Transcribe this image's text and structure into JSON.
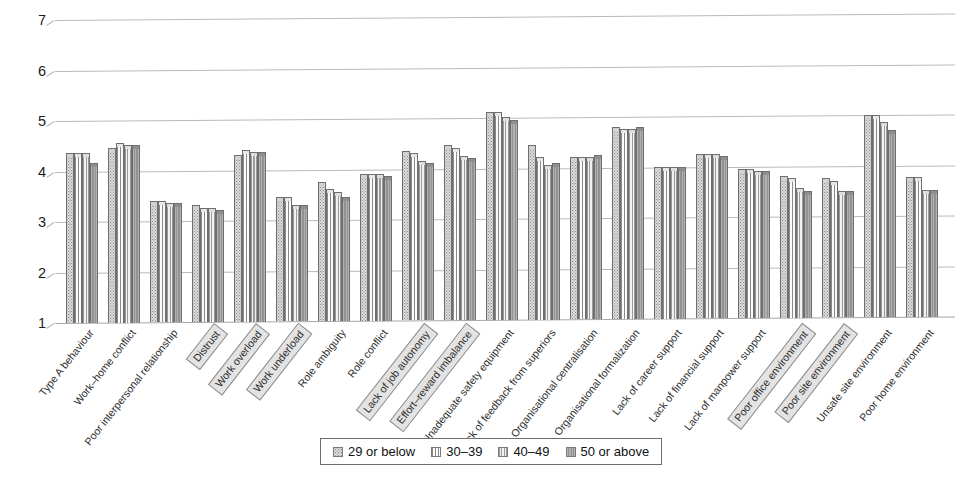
{
  "chart_data": {
    "type": "bar",
    "title": "",
    "subtitle": "",
    "xlabel": "",
    "ylabel": "",
    "ylim": [
      1,
      7
    ],
    "yticks": [
      1,
      2,
      3,
      4,
      5,
      6,
      7
    ],
    "ytick_labels": [
      "1",
      "2",
      "3",
      "4",
      "5",
      "6",
      "7"
    ],
    "grid": true,
    "legend_position": "bottom",
    "categories": [
      "Type A behaviour",
      "Work–home conflict",
      "Poor interpersonal relationship",
      "Distrust",
      "Work overload",
      "Work underload",
      "Role ambiguity",
      "Role conflict",
      "Lack of job autonomy",
      "Effort–reward imbalance",
      "Inadequate safety equipment",
      "Lack of feedback from superiors",
      "Organisational centralisation",
      "Organisational formalization",
      "Lack of career support",
      "Lack of financial support",
      "Lack of manpower support",
      "Poor office environment",
      "Poor site environment",
      "Unsafe site environment",
      "Poor home environment"
    ],
    "highlighted_categories": [
      "Distrust",
      "Work overload",
      "Work underload",
      "Lack of job autonomy",
      "Effort–reward imbalance",
      "Poor office environment",
      "Poor site environment"
    ],
    "series": [
      {
        "name": "29 or below",
        "pattern": "checkered",
        "color": "#dcdcdc",
        "values": [
          4.3,
          4.4,
          3.35,
          3.25,
          4.25,
          3.4,
          3.7,
          3.85,
          4.3,
          4.4,
          5.05,
          4.4,
          4.15,
          4.75,
          3.95,
          4.2,
          3.9,
          3.75,
          3.7,
          4.95,
          3.7
        ]
      },
      {
        "name": "30–39",
        "pattern": "vertical-lines",
        "color": "#f2f2f2",
        "values": [
          4.3,
          4.5,
          3.35,
          3.2,
          4.35,
          3.4,
          3.55,
          3.85,
          4.25,
          4.35,
          5.05,
          4.15,
          4.15,
          4.7,
          3.95,
          4.2,
          3.9,
          3.7,
          3.65,
          4.95,
          3.7
        ]
      },
      {
        "name": "40–49",
        "pattern": "horizontal-lines",
        "color": "#eaeaea",
        "values": [
          4.3,
          4.45,
          3.3,
          3.2,
          4.3,
          3.25,
          3.5,
          3.85,
          4.1,
          4.2,
          4.95,
          4.0,
          4.15,
          4.7,
          3.95,
          4.2,
          3.85,
          3.5,
          3.45,
          4.8,
          3.45
        ]
      },
      {
        "name": "50 or above",
        "pattern": "solid",
        "color": "#9b9b9b",
        "values": [
          4.1,
          4.45,
          3.3,
          3.15,
          4.3,
          3.25,
          3.4,
          3.8,
          4.05,
          4.15,
          4.9,
          4.05,
          4.2,
          4.75,
          3.95,
          4.15,
          3.85,
          3.45,
          3.45,
          4.65,
          3.45
        ]
      }
    ]
  },
  "legend": {
    "items": [
      {
        "label": "29 or below",
        "swatch": "checkered-swatch"
      },
      {
        "label": "30–39",
        "swatch": "vertical-lines-swatch"
      },
      {
        "label": "40–49",
        "swatch": "horizontal-lines-swatch"
      },
      {
        "label": "50 or above",
        "swatch": "solid-swatch"
      }
    ]
  }
}
